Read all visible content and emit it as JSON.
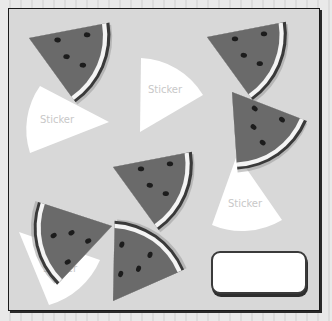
{
  "puzzle": {
    "title": "",
    "sticker_label": "Sticker",
    "counts": {
      "watermelon_slices": 7,
      "stickers": 4
    },
    "colors": {
      "board_bg": "#d8d8d8",
      "flesh": "#6a6a6a",
      "rind_light": "#f4f4f4",
      "rind_dark": "#3a3a3a",
      "seed": "#1c1c1c",
      "sticker": "#ffffff",
      "sticker_text": "#cfcfcf",
      "frame": "#1a1a1a"
    },
    "watermelons": [
      {
        "id": "wm-1",
        "position": "top-left"
      },
      {
        "id": "wm-2",
        "position": "top-right"
      },
      {
        "id": "wm-3",
        "position": "middle-right"
      },
      {
        "id": "wm-4",
        "position": "center"
      },
      {
        "id": "wm-5",
        "position": "middle-left"
      },
      {
        "id": "wm-6",
        "position": "bottom-center"
      },
      {
        "id": "wm-7",
        "position": "none"
      }
    ],
    "stickers": [
      {
        "id": "st-1",
        "label": "Sticker",
        "position": "top-center"
      },
      {
        "id": "st-2",
        "label": "Sticker",
        "position": "upper-left"
      },
      {
        "id": "st-3",
        "label": "Sticker",
        "position": "right"
      },
      {
        "id": "st-4",
        "label": "Sticker",
        "position": "bottom-left"
      }
    ],
    "answer_box": {
      "value": "",
      "placeholder": ""
    }
  }
}
